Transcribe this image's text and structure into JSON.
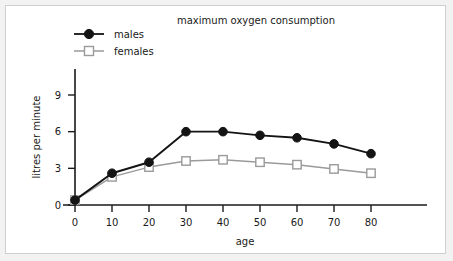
{
  "chart_data": {
    "type": "line",
    "title": "maximum oxygen consumption",
    "xlabel": "age",
    "ylabel": "litres per minute",
    "x": [
      0,
      10,
      20,
      30,
      40,
      50,
      60,
      70,
      80
    ],
    "xticklabels": [
      "0",
      "10",
      "20",
      "30",
      "40",
      "50",
      "60",
      "70",
      "80"
    ],
    "yticklabels": [
      "0",
      "3",
      "6",
      "9"
    ],
    "yticks": [
      0,
      3,
      6,
      9
    ],
    "xlim": [
      0,
      80
    ],
    "ylim": [
      0,
      10.5
    ],
    "grid": false,
    "legend_position": "top-left",
    "series": [
      {
        "name": "males",
        "color": "#141414",
        "marker": "filled-circle",
        "values": [
          0.4,
          2.6,
          3.5,
          6.0,
          6.0,
          5.7,
          5.5,
          5.0,
          4.2
        ]
      },
      {
        "name": "females",
        "color": "#9a9a9a",
        "marker": "open-square",
        "values": [
          0.4,
          2.3,
          3.1,
          3.6,
          3.7,
          3.5,
          3.3,
          2.95,
          2.6
        ]
      }
    ]
  },
  "legend": {
    "items": [
      {
        "label": "males"
      },
      {
        "label": "females"
      }
    ]
  },
  "colors": {
    "males": "#141414",
    "females": "#9a9a9a",
    "axis": "#1a1a1a",
    "panel_background": "#ffffff",
    "page_background": "#f2f2f2",
    "border": "#cfcfcf"
  }
}
